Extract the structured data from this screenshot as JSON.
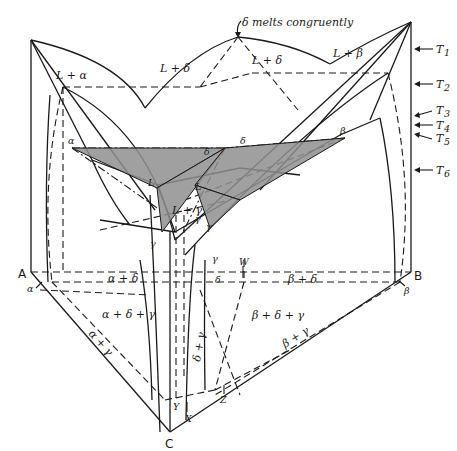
{
  "diagram": {
    "type": "ternary-phase-diagram-3d",
    "annotation": "δ melts congruently",
    "components": {
      "A": "A",
      "B": "B",
      "C": "C"
    },
    "temperatures": [
      "T1",
      "T2",
      "T3",
      "T4",
      "T5",
      "T6"
    ],
    "temperature_labels": {
      "t1": "T",
      "t1_sub": "1",
      "t2": "T",
      "t2_sub": "2",
      "t3": "T",
      "t3_sub": "3",
      "t4": "T",
      "t4_sub": "4",
      "t5": "T",
      "t5_sub": "5",
      "t6": "T",
      "t6_sub": "6"
    },
    "regions_top": {
      "l_alpha": "L + α",
      "l_delta_left": "L + δ",
      "l_delta_right": "L + δ",
      "l_beta": "L + β",
      "l_gamma": "L + γ"
    },
    "tie_points": {
      "alpha": "α",
      "delta_left": "δ",
      "delta_right": "δ",
      "beta": "β",
      "l_left": "L",
      "l_right": "L",
      "gamma_left": "γ",
      "gamma_mid": "γ",
      "gamma_upper": "γ"
    },
    "base_regions": {
      "alpha_delta": "α + δ",
      "beta_delta": "β + δ",
      "alpha_delta_gamma": "α + δ + γ",
      "beta_delta_gamma": "β + δ + γ",
      "alpha_gamma": "α + γ",
      "beta_gamma": "β + γ",
      "delta_gamma": "δ + γ"
    },
    "base_points": {
      "alpha": "α",
      "beta": "β",
      "gamma": "γ",
      "delta": "δ",
      "gamma_top": "γ",
      "W": "W",
      "X": "X",
      "Y": "Y",
      "Z": "Z"
    }
  }
}
